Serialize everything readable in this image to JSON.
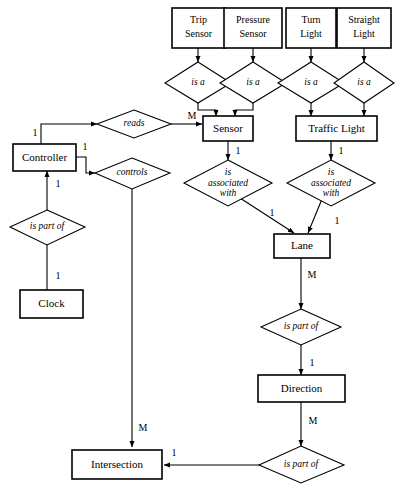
{
  "diagram": {
    "type": "entity-relationship",
    "background_color": "#ffffff",
    "line_color": "#000000",
    "entities": [
      {
        "id": "trip_sensor",
        "label_line1": "Trip",
        "label_line2": "Sensor"
      },
      {
        "id": "pressure_sensor",
        "label_line1": "Pressure",
        "label_line2": "Sensor"
      },
      {
        "id": "turn_light",
        "label_line1": "Turn",
        "label_line2": "Light"
      },
      {
        "id": "straight_light",
        "label_line1": "Straight",
        "label_line2": "Light"
      },
      {
        "id": "sensor",
        "label": "Sensor"
      },
      {
        "id": "traffic_light",
        "label": "Traffic Light"
      },
      {
        "id": "controller",
        "label": "Controller"
      },
      {
        "id": "clock",
        "label": "Clock"
      },
      {
        "id": "lane",
        "label": "Lane"
      },
      {
        "id": "direction",
        "label": "Direction"
      },
      {
        "id": "intersection",
        "label": "Intersection"
      }
    ],
    "relationships": [
      {
        "id": "isa_trip",
        "label": "is a"
      },
      {
        "id": "isa_pressure",
        "label": "is a"
      },
      {
        "id": "isa_turn",
        "label": "is a"
      },
      {
        "id": "isa_straight",
        "label": "is a"
      },
      {
        "id": "reads",
        "label": "reads"
      },
      {
        "id": "controls",
        "label": "controls"
      },
      {
        "id": "is_part_of_clock",
        "label": "is part of"
      },
      {
        "id": "assoc_sensor_lane",
        "label_line1": "is",
        "label_line2": "associated",
        "label_line3": "with"
      },
      {
        "id": "assoc_light_lane",
        "label_line1": "is",
        "label_line2": "associated",
        "label_line3": "with"
      },
      {
        "id": "is_part_of_lane",
        "label": "is part of"
      },
      {
        "id": "is_part_of_direction",
        "label": "is part of"
      }
    ],
    "cardinalities": [
      {
        "id": "card_controller_reads",
        "value": "1"
      },
      {
        "id": "card_reads_sensor",
        "value": "M"
      },
      {
        "id": "card_controller_controls",
        "value": "1"
      },
      {
        "id": "card_controller_ispartof",
        "value": "1"
      },
      {
        "id": "card_clock_ispartof",
        "value": "1"
      },
      {
        "id": "card_sensor_assoc",
        "value": "1"
      },
      {
        "id": "card_light_assoc",
        "value": "1"
      },
      {
        "id": "card_assoc_sensor_lane",
        "value": "1"
      },
      {
        "id": "card_assoc_light_lane",
        "value": "1"
      },
      {
        "id": "card_lane_ispartof",
        "value": "M"
      },
      {
        "id": "card_ispartof_direction",
        "value": "1"
      },
      {
        "id": "card_direction_ispartof",
        "value": "M"
      },
      {
        "id": "card_ispartof_intersection",
        "value": "1"
      },
      {
        "id": "card_controls_intersection",
        "value": "M"
      }
    ]
  }
}
